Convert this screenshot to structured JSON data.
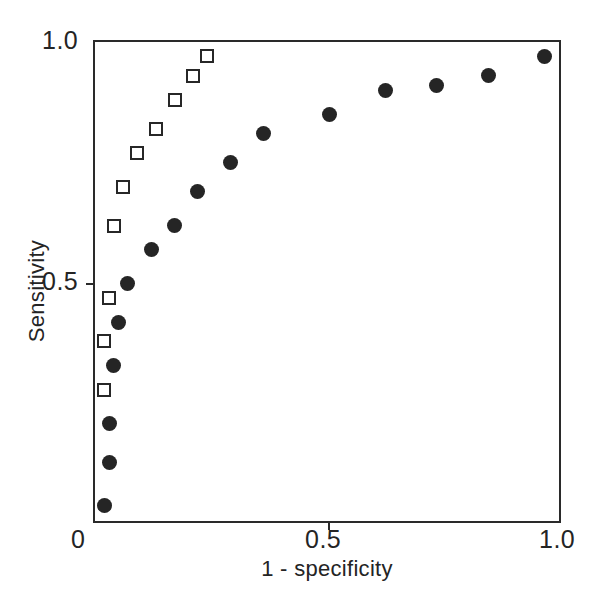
{
  "chart_data": {
    "type": "scatter",
    "title": "",
    "xlabel": "1 - specificity",
    "ylabel": "Sensitivity",
    "xlim": [
      0,
      1.0
    ],
    "ylim": [
      0,
      1.0
    ],
    "xticks": [
      0,
      0.5,
      1.0
    ],
    "xtick_labels": [
      "0",
      "0.5",
      "1.0"
    ],
    "yticks": [
      0.5,
      1.0
    ],
    "ytick_labels": [
      "0.5",
      "1.0"
    ],
    "grid": false,
    "legend": "none",
    "series": [
      {
        "name": "filled-circles",
        "marker": "filled-circle",
        "color": "#252525",
        "points": [
          {
            "x": 0.02,
            "y": 0.04
          },
          {
            "x": 0.03,
            "y": 0.13
          },
          {
            "x": 0.03,
            "y": 0.21
          },
          {
            "x": 0.04,
            "y": 0.33
          },
          {
            "x": 0.05,
            "y": 0.42
          },
          {
            "x": 0.07,
            "y": 0.5
          },
          {
            "x": 0.12,
            "y": 0.57
          },
          {
            "x": 0.17,
            "y": 0.62
          },
          {
            "x": 0.22,
            "y": 0.69
          },
          {
            "x": 0.29,
            "y": 0.75
          },
          {
            "x": 0.36,
            "y": 0.81
          },
          {
            "x": 0.5,
            "y": 0.85
          },
          {
            "x": 0.62,
            "y": 0.9
          },
          {
            "x": 0.73,
            "y": 0.91
          },
          {
            "x": 0.84,
            "y": 0.93
          },
          {
            "x": 0.96,
            "y": 0.97
          }
        ]
      },
      {
        "name": "open-squares",
        "marker": "open-square",
        "color": "#272727",
        "points": [
          {
            "x": 0.02,
            "y": 0.28
          },
          {
            "x": 0.02,
            "y": 0.38
          },
          {
            "x": 0.03,
            "y": 0.47
          },
          {
            "x": 0.04,
            "y": 0.62
          },
          {
            "x": 0.06,
            "y": 0.7
          },
          {
            "x": 0.09,
            "y": 0.77
          },
          {
            "x": 0.13,
            "y": 0.82
          },
          {
            "x": 0.17,
            "y": 0.88
          },
          {
            "x": 0.21,
            "y": 0.93
          },
          {
            "x": 0.24,
            "y": 0.97
          }
        ]
      }
    ]
  },
  "axes": {
    "y_label": "Sensitivity",
    "x_label": "1 - specificity",
    "y_tick_top": "1.0",
    "y_tick_mid": "0.5",
    "x_tick_zero": "0",
    "x_tick_mid": "0.5",
    "x_tick_max": "1.0"
  },
  "colors": {
    "axis": "#2a2a2a",
    "text": "#242424",
    "marker_fill": "#252525",
    "marker_open_border": "#272727",
    "background": "#ffffff"
  }
}
